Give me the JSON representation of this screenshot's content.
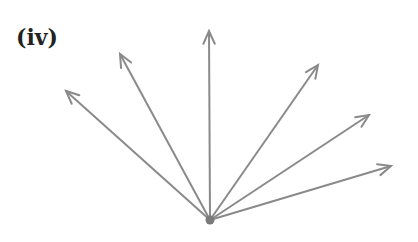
{
  "label": "(iv)",
  "diagram": {
    "type": "vector-fan",
    "origin": [
      210,
      220
    ],
    "line_color": "#8a8a8a",
    "dot_color": "#7a7a7a",
    "arrows": [
      {
        "name": "arrow-1",
        "tip": [
          66,
          91
        ]
      },
      {
        "name": "arrow-2",
        "tip": [
          120,
          54
        ]
      },
      {
        "name": "arrow-3",
        "tip": [
          209,
          31
        ]
      },
      {
        "name": "arrow-4",
        "tip": [
          318,
          65
        ]
      },
      {
        "name": "arrow-5",
        "tip": [
          369,
          115
        ]
      },
      {
        "name": "arrow-6",
        "tip": [
          391,
          166
        ]
      }
    ]
  }
}
